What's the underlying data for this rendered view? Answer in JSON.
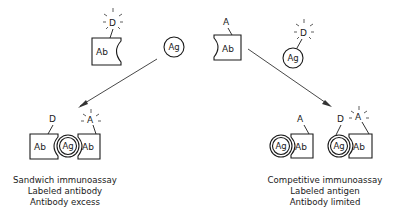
{
  "labels": {
    "antibody": "Ab",
    "antigen": "Ag",
    "detector_label": "D",
    "anchor_label": "A"
  },
  "reactants": {
    "labeled_antibody": {
      "body": "Ab",
      "tag": "D",
      "tag_glowing": true
    },
    "antigen": {
      "body": "Ag"
    },
    "anchored_antibody": {
      "body": "Ab",
      "tag": "A",
      "tag_glowing": false
    },
    "labeled_antigen": {
      "body": "Ag",
      "tag": "D",
      "tag_glowing": true
    }
  },
  "sandwich": {
    "left_ab": "Ab",
    "center_ag": "Ag",
    "right_ab": "Ab",
    "left_tag": "D",
    "right_tag": "A",
    "caption": [
      "Sandwich immunoassay",
      "Labeled antibody",
      "Antibody excess"
    ]
  },
  "competitive": {
    "complex1": {
      "ag": "Ag",
      "ab": "Ab",
      "tag": "A"
    },
    "complex2": {
      "ag": "Ag",
      "ab": "Ab",
      "ag_tag": "D",
      "ab_tag": "A",
      "ab_tag_glowing": true
    },
    "caption": [
      "Competitive immunoassay",
      "Labeled antigen",
      "Antibody limited"
    ]
  },
  "colors": {
    "ink": "#1a1a1a",
    "background": "#ffffff"
  }
}
